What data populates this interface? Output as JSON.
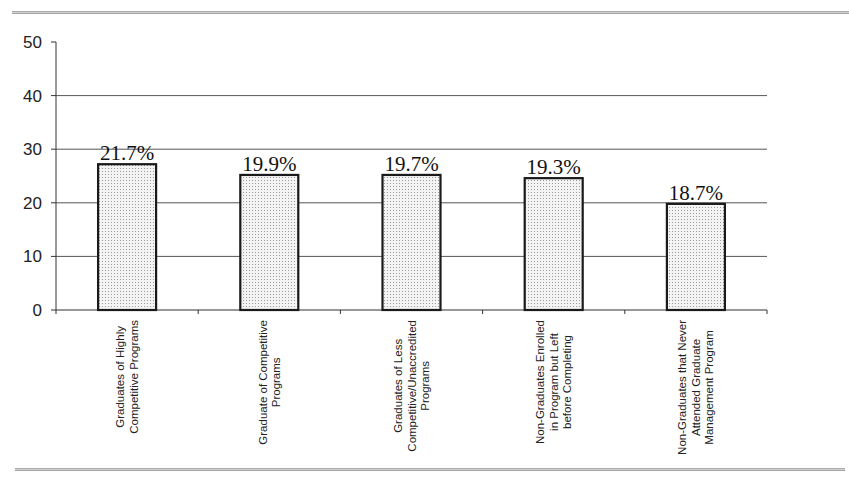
{
  "chart_data": {
    "type": "bar",
    "title": "",
    "xlabel": "",
    "ylabel": "",
    "ylim": [
      0,
      50
    ],
    "yticks": [
      0,
      10,
      20,
      30,
      40,
      50
    ],
    "grid": true,
    "legend": null,
    "categories": [
      [
        "Graduates of Highly",
        "Competitive Programs"
      ],
      [
        "Graduate of Competitive",
        "Programs"
      ],
      [
        "Graduates of Less",
        "Competitive/Unaccredited",
        "Programs"
      ],
      [
        "Non-Graduates Enrolled",
        "in Program but Left",
        "before Completing"
      ],
      [
        "Non-Graduates that Never",
        "Attended Graduate",
        "Management Program"
      ]
    ],
    "category_names": [
      "Graduates of Highly Competitive Programs",
      "Graduate of Competitive Programs",
      "Graduates of Less Competitive/Unaccredited Programs",
      "Non-Graduates Enrolled in Program but Left before Completing",
      "Non-Graduates that Never Attended Graduate Management Program"
    ],
    "values": [
      27.2,
      25.2,
      25.2,
      24.6,
      19.8
    ],
    "data_labels": [
      "21.7%",
      "19.9%",
      "19.7%",
      "19.3%",
      "18.7%"
    ],
    "colors": {
      "bar_fill": "#e8e8e8",
      "bar_stroke": "#1a1a1a",
      "grid": "#555555"
    }
  }
}
